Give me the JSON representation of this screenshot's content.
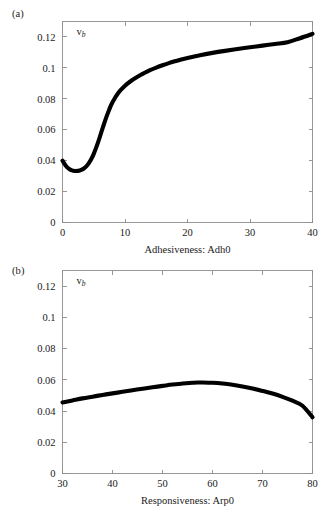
{
  "figure": {
    "panels": [
      {
        "tag": "(a)",
        "series_label": "v",
        "series_label_sub": "b",
        "xlabel": "Adhesiveness: Adh0",
        "xticks": [
          "0",
          "10",
          "20",
          "30",
          "40"
        ],
        "yticks": [
          "0",
          "0.02",
          "0.04",
          "0.06",
          "0.08",
          "0.1",
          "0.12"
        ]
      },
      {
        "tag": "(b)",
        "series_label": "v",
        "series_label_sub": "b",
        "xlabel": "Responsiveness: Arp0",
        "xticks": [
          "30",
          "40",
          "50",
          "60",
          "70",
          "80"
        ],
        "yticks": [
          "0",
          "0.02",
          "0.04",
          "0.06",
          "0.08",
          "0.1",
          "0.12"
        ]
      }
    ],
    "colors": {
      "curve": "#000000",
      "axis": "#8c8c8c",
      "text": "#1a1a1a",
      "background": "#ffffff"
    }
  },
  "chart_data": [
    {
      "type": "line",
      "panel": "(a)",
      "title": "",
      "xlabel": "Adhesiveness: Adh0",
      "ylabel": "v_b",
      "xlim": [
        0,
        40
      ],
      "ylim": [
        0,
        0.13
      ],
      "xticks": [
        0,
        10,
        20,
        30,
        40
      ],
      "yticks": [
        0,
        0.02,
        0.04,
        0.06,
        0.08,
        0.1,
        0.12
      ],
      "grid": false,
      "legend": "none",
      "series": [
        {
          "name": "v_b",
          "x": [
            0,
            0.5,
            1,
            1.5,
            2,
            2.5,
            3,
            3.5,
            4,
            4.5,
            5,
            5.5,
            6,
            6.5,
            7,
            7.5,
            8,
            9,
            10,
            11,
            12,
            13,
            14,
            15,
            16,
            17,
            18,
            19,
            20,
            22,
            24,
            26,
            28,
            30,
            32,
            34,
            36,
            38,
            40
          ],
          "values": [
            0.04,
            0.0369,
            0.0348,
            0.0337,
            0.0333,
            0.0334,
            0.034,
            0.0352,
            0.0372,
            0.0402,
            0.0444,
            0.0497,
            0.0557,
            0.062,
            0.068,
            0.0733,
            0.0778,
            0.0842,
            0.0885,
            0.0917,
            0.0943,
            0.0965,
            0.0985,
            0.1002,
            0.1017,
            0.1031,
            0.1043,
            0.1054,
            0.1064,
            0.1082,
            0.1097,
            0.111,
            0.1122,
            0.1133,
            0.1144,
            0.1155,
            0.1166,
            0.1192,
            0.122
          ]
        }
      ]
    },
    {
      "type": "line",
      "panel": "(b)",
      "title": "",
      "xlabel": "Responsiveness: Arp0",
      "ylabel": "v_b",
      "xlim": [
        30,
        80
      ],
      "ylim": [
        0,
        0.13
      ],
      "xticks": [
        30,
        40,
        50,
        60,
        70,
        80
      ],
      "yticks": [
        0,
        0.02,
        0.04,
        0.06,
        0.08,
        0.1,
        0.12
      ],
      "grid": false,
      "legend": "none",
      "series": [
        {
          "name": "v_b",
          "x": [
            30,
            32,
            34,
            36,
            38,
            40,
            42,
            44,
            46,
            48,
            50,
            52,
            54,
            56,
            57,
            58,
            60,
            62,
            64,
            66,
            68,
            70,
            72,
            74,
            76,
            78,
            80
          ],
          "values": [
            0.0455,
            0.0468,
            0.0481,
            0.0492,
            0.0503,
            0.0513,
            0.0523,
            0.0533,
            0.0543,
            0.0552,
            0.0561,
            0.057,
            0.0576,
            0.0581,
            0.0583,
            0.0583,
            0.0581,
            0.0576,
            0.0568,
            0.0557,
            0.0544,
            0.0529,
            0.0512,
            0.0491,
            0.0466,
            0.0434,
            0.036
          ]
        }
      ]
    }
  ]
}
